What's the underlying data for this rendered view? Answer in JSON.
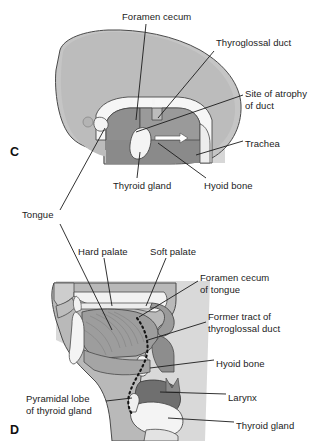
{
  "figure": {
    "panels": [
      {
        "letter": "C",
        "name": "embryonic-head-sagittal-section",
        "labels": [
          {
            "text": "Foramen cecum",
            "x": 122,
            "y": 16
          },
          {
            "text": "Thyroglossal duct",
            "x": 216,
            "y": 42
          },
          {
            "text": "Site of atrophy",
            "x": 245,
            "y": 93
          },
          {
            "text": "of duct",
            "x": 245,
            "y": 105
          },
          {
            "text": "Trachea",
            "x": 245,
            "y": 143
          },
          {
            "text": "Thyroid gland",
            "x": 113,
            "y": 185
          },
          {
            "text": "Hyoid bone",
            "x": 204,
            "y": 185
          }
        ]
      },
      {
        "letter": "D",
        "name": "adult-head-neck-sagittal-section",
        "labels": [
          {
            "text": "Tongue",
            "x": 22,
            "y": 214
          },
          {
            "text": "Hard palate",
            "x": 78,
            "y": 251
          },
          {
            "text": "Soft palate",
            "x": 150,
            "y": 251
          },
          {
            "text": "Foramen cecum",
            "x": 200,
            "y": 277
          },
          {
            "text": "of tongue",
            "x": 200,
            "y": 289
          },
          {
            "text": "Former tract of",
            "x": 208,
            "y": 316
          },
          {
            "text": "thyroglossal duct",
            "x": 208,
            "y": 328
          },
          {
            "text": "Hyoid bone",
            "x": 216,
            "y": 363
          },
          {
            "text": "Larynx",
            "x": 228,
            "y": 397
          },
          {
            "text": "Thyroid gland",
            "x": 236,
            "y": 425
          },
          {
            "text": "Pyramidal lobe",
            "x": 26,
            "y": 398
          },
          {
            "text": "of thyroid gland",
            "x": 26,
            "y": 410
          }
        ]
      }
    ],
    "colors": {
      "background": "#ffffff",
      "skin_light": "#c9c9c9",
      "tissue_mid": "#a8a8a8",
      "tissue_dark": "#8a8a8a",
      "muscle_dark": "#777777",
      "bone_white": "#f4f4f4",
      "outline": "#3c3c3c",
      "leader_line": "#1b1b1b",
      "text": "#1b1b1b",
      "duct_dotted": "#141414"
    }
  }
}
